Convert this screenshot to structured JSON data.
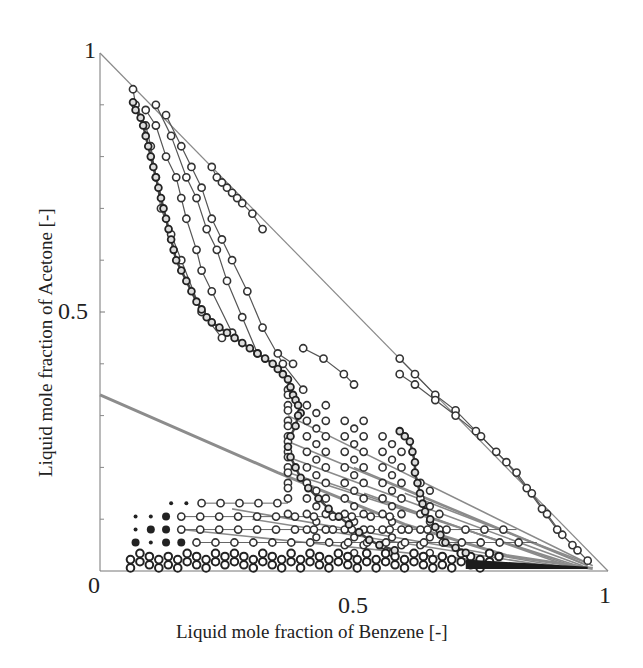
{
  "chart_data": {
    "type": "scatter",
    "title": "",
    "xlabel": "Liquid mole fraction of Benzene [-]",
    "ylabel": "Liquid mole fraction of Acetone [-]",
    "xlim": [
      0,
      1
    ],
    "ylim": [
      0,
      1
    ],
    "grid": false,
    "legend": null,
    "x_ticks": [
      "0",
      "0.5",
      "1"
    ],
    "y_ticks": [
      "0",
      "0.5",
      "1"
    ],
    "y_minor_ticks": [
      0.1,
      0.2,
      0.3,
      0.4,
      0.6,
      0.7,
      0.8,
      0.9
    ],
    "boundary_line": {
      "points": [
        [
          0,
          1
        ],
        [
          1,
          0
        ]
      ],
      "color": "#8a8a8a"
    },
    "gray_thick_line": {
      "points": [
        [
          0,
          0.34
        ],
        [
          0.35,
          0.19
        ],
        [
          0.6,
          0.09
        ],
        [
          0.8,
          0.03
        ],
        [
          0.97,
          0.005
        ]
      ],
      "color": "#8c8c8c"
    },
    "dense_curves": [
      {
        "name": "main trajectory",
        "points": [
          [
            0.065,
            0.905
          ],
          [
            0.07,
            0.89
          ],
          [
            0.08,
            0.875
          ],
          [
            0.085,
            0.86
          ],
          [
            0.09,
            0.84
          ],
          [
            0.095,
            0.82
          ],
          [
            0.1,
            0.8
          ],
          [
            0.105,
            0.78
          ],
          [
            0.11,
            0.76
          ],
          [
            0.115,
            0.74
          ],
          [
            0.12,
            0.72
          ],
          [
            0.125,
            0.7
          ],
          [
            0.13,
            0.68
          ],
          [
            0.135,
            0.66
          ],
          [
            0.14,
            0.64
          ],
          [
            0.145,
            0.62
          ],
          [
            0.15,
            0.6
          ],
          [
            0.16,
            0.58
          ],
          [
            0.17,
            0.56
          ],
          [
            0.18,
            0.54
          ],
          [
            0.19,
            0.52
          ],
          [
            0.2,
            0.505
          ],
          [
            0.21,
            0.49
          ],
          [
            0.22,
            0.48
          ],
          [
            0.235,
            0.47
          ],
          [
            0.25,
            0.46
          ],
          [
            0.265,
            0.45
          ],
          [
            0.28,
            0.44
          ],
          [
            0.295,
            0.43
          ],
          [
            0.31,
            0.42
          ],
          [
            0.325,
            0.41
          ],
          [
            0.34,
            0.4
          ],
          [
            0.35,
            0.39
          ],
          [
            0.36,
            0.38
          ],
          [
            0.37,
            0.37
          ],
          [
            0.375,
            0.355
          ],
          [
            0.38,
            0.34
          ],
          [
            0.385,
            0.33
          ],
          [
            0.39,
            0.32
          ],
          [
            0.395,
            0.305
          ]
        ]
      },
      {
        "name": "inner loop",
        "points": [
          [
            0.39,
            0.3
          ],
          [
            0.385,
            0.28
          ],
          [
            0.375,
            0.26
          ],
          [
            0.37,
            0.24
          ],
          [
            0.375,
            0.22
          ],
          [
            0.385,
            0.2
          ],
          [
            0.395,
            0.18
          ],
          [
            0.41,
            0.16
          ],
          [
            0.43,
            0.14
          ],
          [
            0.45,
            0.12
          ],
          [
            0.47,
            0.105
          ],
          [
            0.49,
            0.09
          ],
          [
            0.51,
            0.075
          ],
          [
            0.53,
            0.06
          ],
          [
            0.55,
            0.05
          ],
          [
            0.58,
            0.04
          ]
        ]
      },
      {
        "name": "right loop",
        "points": [
          [
            0.59,
            0.27
          ],
          [
            0.6,
            0.26
          ],
          [
            0.61,
            0.25
          ],
          [
            0.615,
            0.23
          ],
          [
            0.62,
            0.21
          ],
          [
            0.62,
            0.19
          ],
          [
            0.625,
            0.17
          ],
          [
            0.63,
            0.15
          ],
          [
            0.635,
            0.13
          ],
          [
            0.64,
            0.115
          ],
          [
            0.65,
            0.1
          ],
          [
            0.66,
            0.085
          ],
          [
            0.67,
            0.07
          ],
          [
            0.68,
            0.055
          ],
          [
            0.7,
            0.045
          ],
          [
            0.72,
            0.035
          ]
        ]
      }
    ],
    "hollow_lines": [
      {
        "points": [
          [
            0.065,
            0.93
          ],
          [
            0.07,
            0.9
          ],
          [
            0.09,
            0.86
          ],
          [
            0.1,
            0.82
          ],
          [
            0.11,
            0.76
          ],
          [
            0.12,
            0.7
          ],
          [
            0.14,
            0.65
          ],
          [
            0.16,
            0.6
          ],
          [
            0.2,
            0.5
          ],
          [
            0.24,
            0.45
          ]
        ]
      },
      {
        "points": [
          [
            0.09,
            0.89
          ],
          [
            0.11,
            0.86
          ],
          [
            0.13,
            0.8
          ],
          [
            0.15,
            0.76
          ],
          [
            0.16,
            0.72
          ],
          [
            0.17,
            0.68
          ],
          [
            0.19,
            0.62
          ],
          [
            0.2,
            0.58
          ],
          [
            0.22,
            0.54
          ],
          [
            0.26,
            0.46
          ]
        ]
      },
      {
        "points": [
          [
            0.11,
            0.9
          ],
          [
            0.14,
            0.84
          ],
          [
            0.17,
            0.76
          ],
          [
            0.19,
            0.72
          ],
          [
            0.21,
            0.66
          ],
          [
            0.23,
            0.62
          ],
          [
            0.25,
            0.56
          ],
          [
            0.28,
            0.49
          ],
          [
            0.31,
            0.42
          ]
        ]
      },
      {
        "points": [
          [
            0.13,
            0.88
          ],
          [
            0.16,
            0.82
          ],
          [
            0.18,
            0.78
          ],
          [
            0.2,
            0.74
          ],
          [
            0.22,
            0.68
          ],
          [
            0.24,
            0.64
          ],
          [
            0.26,
            0.6
          ],
          [
            0.29,
            0.54
          ],
          [
            0.32,
            0.47
          ],
          [
            0.36,
            0.4
          ],
          [
            0.4,
            0.35
          ]
        ]
      },
      {
        "points": [
          [
            0.22,
            0.78
          ],
          [
            0.23,
            0.76
          ],
          [
            0.24,
            0.75
          ],
          [
            0.25,
            0.74
          ],
          [
            0.26,
            0.73
          ],
          [
            0.27,
            0.72
          ],
          [
            0.28,
            0.71
          ],
          [
            0.3,
            0.69
          ],
          [
            0.32,
            0.66
          ]
        ]
      },
      {
        "points": [
          [
            0.4,
            0.43
          ],
          [
            0.44,
            0.41
          ],
          [
            0.48,
            0.38
          ],
          [
            0.5,
            0.36
          ]
        ]
      },
      {
        "points": [
          [
            0.35,
            0.42
          ],
          [
            0.38,
            0.4
          ]
        ]
      },
      {
        "points": [
          [
            0.59,
            0.41
          ],
          [
            0.62,
            0.38
          ],
          [
            0.66,
            0.34
          ],
          [
            0.7,
            0.31
          ],
          [
            0.74,
            0.27
          ],
          [
            0.78,
            0.23
          ],
          [
            0.82,
            0.19
          ],
          [
            0.85,
            0.15
          ],
          [
            0.88,
            0.11
          ],
          [
            0.91,
            0.07
          ],
          [
            0.94,
            0.04
          ],
          [
            0.96,
            0.02
          ]
        ]
      },
      {
        "points": [
          [
            0.59,
            0.38
          ],
          [
            0.62,
            0.36
          ],
          [
            0.66,
            0.33
          ],
          [
            0.7,
            0.3
          ],
          [
            0.75,
            0.26
          ],
          [
            0.8,
            0.21
          ],
          [
            0.84,
            0.16
          ],
          [
            0.87,
            0.12
          ],
          [
            0.9,
            0.08
          ],
          [
            0.93,
            0.05
          ]
        ]
      }
    ],
    "grid_points": {
      "x_start": 0.37,
      "x_step": 0.0745,
      "columns": 9,
      "rows": [
        {
          "y": 0.35,
          "from": 0,
          "to": 1
        },
        {
          "y": 0.32,
          "from": 0,
          "to": 3
        },
        {
          "y": 0.29,
          "from": 0,
          "to": 5
        },
        {
          "y": 0.26,
          "from": 0,
          "to": 6
        },
        {
          "y": 0.23,
          "from": 0,
          "to": 7
        },
        {
          "y": 0.2,
          "from": 0,
          "to": 7
        },
        {
          "y": 0.17,
          "from": 0,
          "to": 8
        },
        {
          "y": 0.14,
          "from": 0,
          "to": 8
        },
        {
          "y": 0.11,
          "from": 0,
          "to": 9
        },
        {
          "y": 0.08,
          "from": 1,
          "to": 9
        },
        {
          "y": 0.05,
          "from": 3,
          "to": 8
        }
      ],
      "fine_x_step": 0.0373
    },
    "bottom_rows": [
      {
        "y": 0.131,
        "dots_x": [
          0.14,
          0.17
        ],
        "circles_from": 0.2,
        "circles_to": 0.37,
        "step": 0.0373
      },
      {
        "y": 0.105,
        "dots_x": [
          0.07,
          0.1
        ],
        "filled_x": [
          0.13
        ],
        "circles_from": 0.16,
        "circles_to": 0.58,
        "step": 0.0373
      },
      {
        "y": 0.08,
        "dots_x": [
          0.07
        ],
        "filled_x": [
          0.1,
          0.13
        ],
        "circles_from": 0.16,
        "circles_to": 0.82,
        "step": 0.0373
      },
      {
        "y": 0.055,
        "filled_x": [
          0.07,
          0.13,
          0.16
        ],
        "dots_x": [
          0.1
        ],
        "circles_from": 0.19,
        "circles_to": 0.86,
        "step": 0.0373
      },
      {
        "y": 0.028,
        "dense": true,
        "from": 0.06,
        "to": 0.8,
        "step": 0.0186
      },
      {
        "y": 0.012,
        "dense": true,
        "from": 0.06,
        "to": 0.78,
        "step": 0.0186
      }
    ],
    "bottom_band": {
      "from": 0.72,
      "to": 0.96,
      "y_top": 0.022,
      "y_bottom": 0.004,
      "color": "#1c1c1c"
    },
    "fan_lines": [
      [
        [
          0.37,
          0.25
        ],
        [
          0.96,
          0.01
        ]
      ],
      [
        [
          0.37,
          0.22
        ],
        [
          0.95,
          0.01
        ]
      ],
      [
        [
          0.37,
          0.19
        ],
        [
          0.94,
          0.01
        ]
      ],
      [
        [
          0.45,
          0.17
        ],
        [
          0.93,
          0.01
        ]
      ],
      [
        [
          0.52,
          0.15
        ],
        [
          0.92,
          0.01
        ]
      ],
      [
        [
          0.37,
          0.3
        ],
        [
          0.97,
          0.01
        ]
      ],
      [
        [
          0.26,
          0.12
        ],
        [
          0.9,
          0.01
        ]
      ],
      [
        [
          0.3,
          0.1
        ],
        [
          0.88,
          0.01
        ]
      ],
      [
        [
          0.5,
          0.2
        ],
        [
          0.95,
          0.015
        ]
      ],
      [
        [
          0.6,
          0.15
        ],
        [
          0.96,
          0.015
        ]
      ],
      [
        [
          0.16,
          0.08
        ],
        [
          0.85,
          0.01
        ]
      ]
    ]
  }
}
